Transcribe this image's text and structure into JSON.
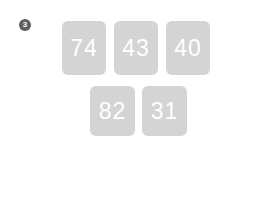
{
  "exercise": {
    "number_badge": "3",
    "cards": [
      {
        "value": "74",
        "row": 1
      },
      {
        "value": "43",
        "row": 1
      },
      {
        "value": "40",
        "row": 1
      },
      {
        "value": "82",
        "row": 2
      },
      {
        "value": "31",
        "row": 2
      }
    ],
    "equation": {
      "operand1": "",
      "plus_symbol": "+",
      "operand2": "",
      "equals_symbol": "=",
      "result": "",
      "operand1_placeholder": "",
      "operand2_placeholder": "",
      "result_placeholder": ""
    },
    "colors": {
      "card_background": "#d4d4d4",
      "card_text": "#ffffff",
      "badge_background": "#5e5e5e",
      "box_border": "#b8b8b8",
      "operator_text": "#808080",
      "page_background": "#ffffff"
    }
  }
}
